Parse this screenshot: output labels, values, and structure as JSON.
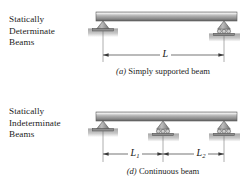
{
  "figure": {
    "name": "beam-support-types",
    "panels": [
      {
        "id": "determinate",
        "category_label_lines": [
          "Statically",
          "Determinate",
          "Beams"
        ],
        "caption_tag": "(a)",
        "caption_text": " Simply supported beam",
        "beam": {
          "label": "beam",
          "left_x": 96,
          "right_x": 237
        },
        "supports": [
          {
            "type": "pin",
            "name": "pin-support-left",
            "x": 103
          },
          {
            "type": "roller",
            "name": "roller-support-right",
            "x": 224,
            "rollers": 3
          }
        ],
        "dimensions": [
          {
            "name": "span-L",
            "label": "L",
            "subscript": "",
            "from_x": 103,
            "to_x": 224,
            "y": 55
          }
        ]
      },
      {
        "id": "indeterminate",
        "category_label_lines": [
          "Statically",
          "Indeterminate",
          "Beams"
        ],
        "caption_tag": "(d)",
        "caption_text": " Continuous beam",
        "beam": {
          "label": "beam",
          "left_x": 96,
          "right_x": 237
        },
        "supports": [
          {
            "type": "pin",
            "name": "pin-support-left",
            "x": 103
          },
          {
            "type": "roller",
            "name": "roller-support-middle",
            "x": 163,
            "rollers": 3
          },
          {
            "type": "roller",
            "name": "roller-support-right",
            "x": 224,
            "rollers": 3
          }
        ],
        "dimensions": [
          {
            "name": "span-L1",
            "label": "L",
            "subscript": "1",
            "from_x": 103,
            "to_x": 163,
            "y": 154
          },
          {
            "name": "span-L2",
            "label": "L",
            "subscript": "2",
            "from_x": 163,
            "to_x": 224,
            "y": 154
          }
        ]
      }
    ]
  },
  "colors": {
    "beam_top": "#d9d9d9",
    "beam_mid": "#a8a8a8",
    "beam_bottom": "#6e6e6e",
    "support_fill": "#9a9a9a",
    "ground_fill": "#b5b5b5",
    "line": "#3a3a3a",
    "text": "#1c1c1c",
    "page_background": "#ffffff"
  }
}
